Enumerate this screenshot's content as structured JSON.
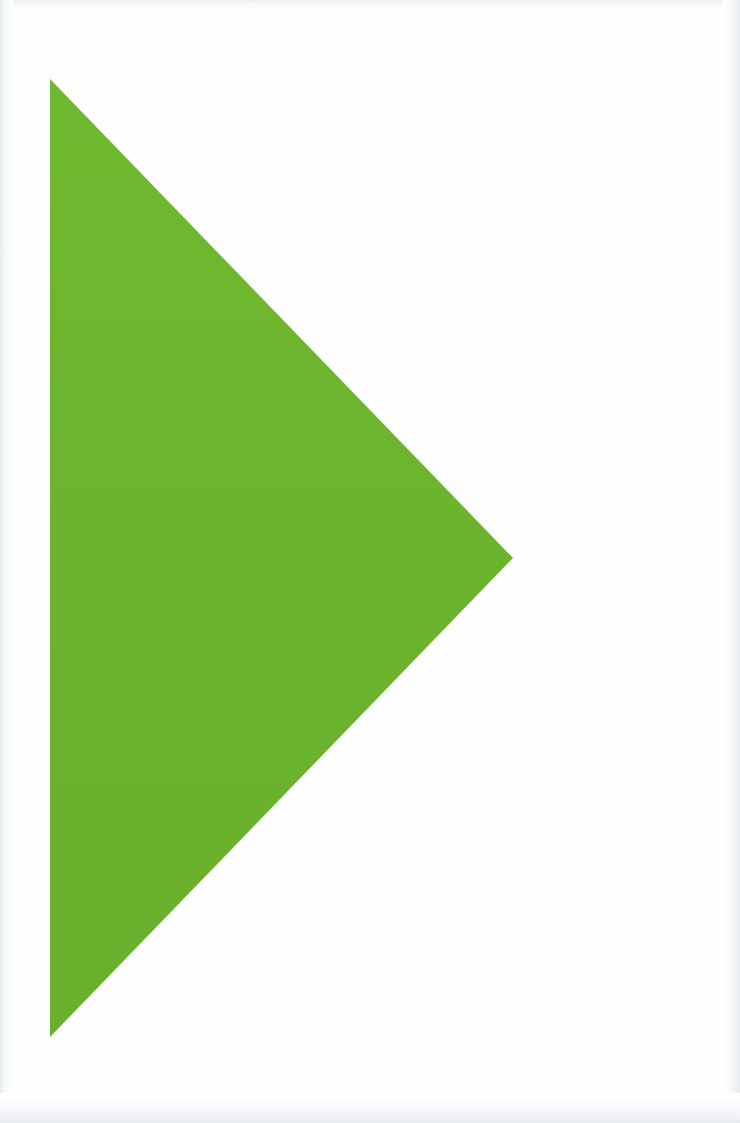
{
  "canvas": {
    "width": 740,
    "height": 1123,
    "background_color": "#fefefe",
    "edge_vignette_color": "#e9ecee"
  },
  "artwork": {
    "title": "Green right-pointing triangle",
    "shape_type": "triangle",
    "orientation": "right-pointing",
    "fill_color": "#6cb42e",
    "fill_color_top": "#6fb92f",
    "fill_color_bottom": "#69b02c",
    "stroke": "none",
    "vertices": [
      {
        "name": "top-left",
        "x": 50,
        "y": 79
      },
      {
        "name": "right-tip",
        "x": 513,
        "y": 558
      },
      {
        "name": "bottom-left",
        "x": 50,
        "y": 1037
      }
    ],
    "points_attribute": "50,79 513,558 50,1037",
    "bounding_box": {
      "x": 50,
      "y": 79,
      "width": 463,
      "height": 958
    },
    "text_content": ""
  }
}
